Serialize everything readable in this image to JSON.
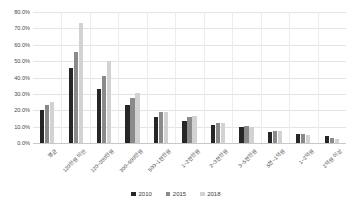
{
  "chart_data": {
    "type": "bar",
    "title": "",
    "xlabel": "",
    "ylabel": "",
    "ylim": [
      0,
      80
    ],
    "ytick_labels": [
      "0.0%",
      "10.0%",
      "20.0%",
      "30.0%",
      "40.0%",
      "50.0%",
      "60.0%",
      "70.0%",
      "80.0%"
    ],
    "ytick_values": [
      0,
      10,
      20,
      30,
      40,
      50,
      60,
      70,
      80
    ],
    "grid": true,
    "legend_position": "bottom",
    "categories": [
      "평균",
      "120만원 미만",
      "120~300만원",
      "300~500만원",
      "500~1천만원",
      "1~2천만원",
      "2~3천만원",
      "3~5천만원",
      "5천~1억원",
      "1~2억원",
      "2억원 이상"
    ],
    "series": [
      {
        "name": "2010",
        "color": "#262626",
        "values": [
          20.0,
          46.0,
          32.8,
          23.0,
          16.0,
          13.5,
          11.0,
          9.5,
          7.0,
          5.5,
          4.2
        ]
      },
      {
        "name": "2015",
        "color": "#8a8a8a",
        "values": [
          23.5,
          55.5,
          40.8,
          27.5,
          18.8,
          15.8,
          12.0,
          10.2,
          7.5,
          5.8,
          3.0
        ]
      },
      {
        "name": "2018",
        "color": "#d2d2d2",
        "values": [
          25.0,
          73.0,
          50.0,
          30.5,
          19.2,
          16.5,
          12.2,
          10.0,
          7.2,
          5.2,
          2.6
        ]
      }
    ]
  },
  "legend": {
    "items": [
      {
        "label": "2010"
      },
      {
        "label": "2015"
      },
      {
        "label": "2018"
      }
    ]
  },
  "footnote": {
    "text": ""
  }
}
